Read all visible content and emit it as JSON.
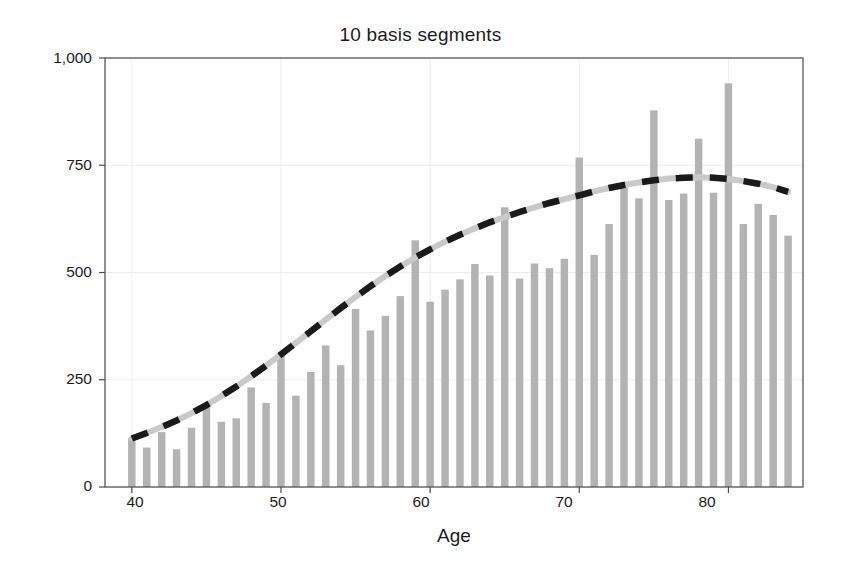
{
  "chart_data": {
    "type": "bar",
    "title": "10 basis segments",
    "xlabel": "Age",
    "ylabel": "Counts",
    "xlim": [
      38.2,
      85.0
    ],
    "ylim": [
      0,
      1000
    ],
    "grid": true,
    "legend": null,
    "xticks": [
      40,
      50,
      60,
      70,
      80
    ],
    "xtick_labels": [
      "40",
      "50",
      "60",
      "70",
      "80"
    ],
    "yticks": [
      0,
      250,
      500,
      750,
      1000
    ],
    "ytick_labels": [
      "0",
      "250",
      "500",
      "750",
      "1,000"
    ],
    "bar_color": "#b3b3b3",
    "line_color": "#c9c9c9",
    "dash_color": "#1a1a1a",
    "categories": [
      40,
      41,
      42,
      43,
      44,
      45,
      46,
      47,
      48,
      49,
      50,
      51,
      52,
      53,
      54,
      55,
      56,
      57,
      58,
      59,
      60,
      61,
      62,
      63,
      64,
      65,
      66,
      67,
      68,
      69,
      70,
      71,
      72,
      73,
      74,
      75,
      76,
      77,
      78,
      79,
      80,
      81,
      82,
      83,
      84
    ],
    "series": [
      {
        "name": "Counts",
        "type": "bar",
        "values": [
          115,
          92,
          128,
          88,
          138,
          190,
          152,
          160,
          232,
          196,
          310,
          213,
          268,
          330,
          284,
          415,
          365,
          399,
          445,
          575,
          432,
          460,
          484,
          520,
          493,
          652,
          486,
          521,
          510,
          532,
          768,
          541,
          613,
          705,
          673,
          878,
          669,
          684,
          812,
          686,
          941,
          613,
          660,
          634,
          586
        ]
      },
      {
        "name": "Smooth fit (10 basis segments)",
        "type": "line",
        "style": "dashed-overlay",
        "x": [
          40,
          41,
          42,
          43,
          44,
          45,
          46,
          47,
          48,
          49,
          50,
          51,
          52,
          53,
          54,
          55,
          56,
          57,
          58,
          59,
          60,
          61,
          62,
          63,
          64,
          65,
          66,
          67,
          68,
          69,
          70,
          71,
          72,
          73,
          74,
          75,
          76,
          77,
          78,
          79,
          80,
          81,
          82,
          83,
          84
        ],
        "values": [
          113,
          126,
          140,
          155,
          172,
          191,
          212,
          234,
          258,
          283,
          309,
          336,
          363,
          390,
          417,
          443,
          468,
          492,
          514,
          535,
          554,
          572,
          588,
          603,
          617,
          629,
          641,
          652,
          662,
          671,
          680,
          689,
          697,
          704,
          710,
          715,
          719,
          721,
          722,
          721,
          718,
          713,
          707,
          699,
          688
        ]
      }
    ]
  },
  "axes": {
    "frame_color": "#4a4a4a",
    "grid_color": "#ececec"
  }
}
